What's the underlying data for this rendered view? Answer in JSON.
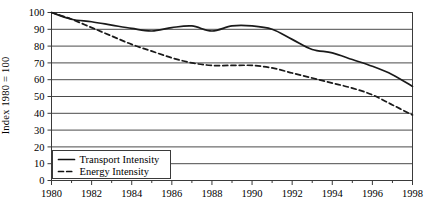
{
  "chart_data": {
    "type": "line",
    "title": "",
    "xlabel": "",
    "ylabel": "Index 1980 = 100",
    "xlim": [
      1980,
      1998
    ],
    "ylim": [
      0,
      100
    ],
    "grid": true,
    "legend_position": "bottom-left",
    "x_ticks_major": [
      1980,
      1982,
      1984,
      1986,
      1988,
      1990,
      1992,
      1994,
      1996,
      1998
    ],
    "x_ticks_minor": [
      1981,
      1983,
      1985,
      1987,
      1989,
      1991,
      1993,
      1995,
      1997
    ],
    "y_ticks": [
      0,
      10,
      20,
      30,
      40,
      50,
      60,
      70,
      80,
      90,
      100
    ],
    "x": [
      1980,
      1981,
      1982,
      1983,
      1984,
      1985,
      1986,
      1987,
      1988,
      1989,
      1990,
      1991,
      1992,
      1993,
      1994,
      1995,
      1996,
      1997,
      1998
    ],
    "series": [
      {
        "name": "Transport Intensity",
        "style": "solid",
        "color": "#1a1a1a",
        "values": [
          100,
          96,
          94.5,
          92.5,
          90.5,
          89,
          91,
          92,
          89,
          92,
          92,
          90,
          84,
          78,
          76,
          72,
          68,
          63,
          56
        ]
      },
      {
        "name": "Energy Intensity",
        "style": "dashed",
        "color": "#1a1a1a",
        "values": [
          100,
          96,
          91,
          86,
          81,
          77,
          73,
          70,
          68.5,
          68.5,
          68.5,
          67,
          64,
          61,
          58,
          55,
          51,
          45,
          39
        ]
      }
    ]
  },
  "axes": {
    "y_tick_labels": [
      "100",
      "90",
      "80",
      "70",
      "60",
      "50",
      "40",
      "30",
      "20",
      "10",
      "0"
    ],
    "x_tick_labels": [
      "1980",
      "1982",
      "1984",
      "1986",
      "1988",
      "1990",
      "1992",
      "1994",
      "1996",
      "1998"
    ],
    "y_axis_title": "Index 1980 = 100"
  },
  "legend": {
    "items": [
      {
        "label": "Transport Intensity",
        "marker": "solid-line-swatch"
      },
      {
        "label": "Energy Intensity",
        "marker": "dashed-line-swatch"
      }
    ]
  },
  "colors": {
    "axis": "#3a3a3a",
    "grid": "#4a4a4a",
    "series": "#111111",
    "background": "#ffffff"
  }
}
